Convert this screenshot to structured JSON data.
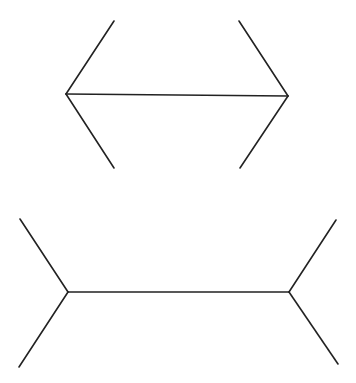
{
  "diagram": {
    "type": "muller-lyer-illusion",
    "background": "#ffffff",
    "stroke_color": "#222222",
    "figures": [
      {
        "name": "arrowheads-inward",
        "shaft": [
          66,
          94,
          288,
          96
        ],
        "fins": [
          [
            66,
            94,
            114,
            21
          ],
          [
            66,
            94,
            114,
            168
          ],
          [
            288,
            96,
            239,
            21
          ],
          [
            288,
            96,
            240,
            168
          ]
        ]
      },
      {
        "name": "arrowheads-outward",
        "shaft": [
          68,
          292,
          289,
          292
        ],
        "fins": [
          [
            68,
            292,
            20,
            219
          ],
          [
            68,
            292,
            19,
            367
          ],
          [
            289,
            292,
            336,
            220
          ],
          [
            289,
            292,
            338,
            364
          ]
        ]
      }
    ]
  }
}
